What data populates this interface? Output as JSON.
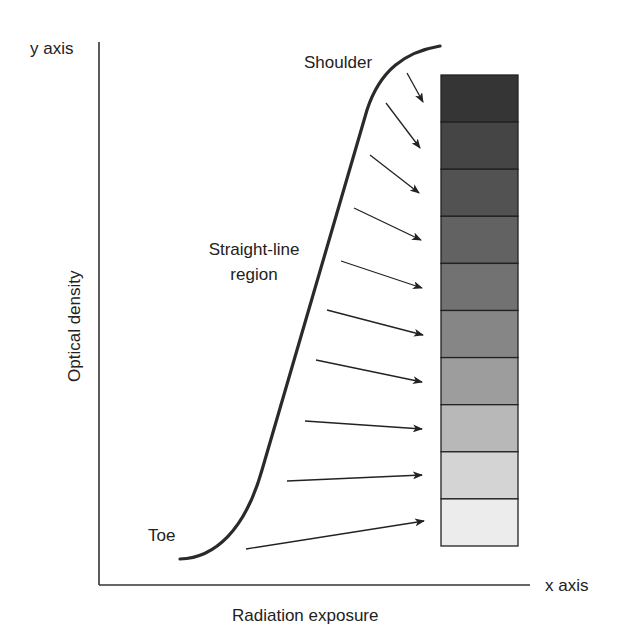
{
  "labels": {
    "y_axis": "y axis",
    "x_axis": "x axis",
    "y_title": "Optical density",
    "x_title": "Radiation exposure",
    "shoulder": "Shoulder",
    "straight_line_1": "Straight-line",
    "straight_line_2": "region",
    "toe": "Toe"
  },
  "step_wedge": {
    "steps": 10,
    "colors": [
      "#353535",
      "#454545",
      "#525252",
      "#626262",
      "#727272",
      "#868686",
      "#9d9d9d",
      "#b8b8b8",
      "#d4d4d4",
      "#ececec"
    ]
  },
  "arrow_count": 10,
  "colors": {
    "ink": "#222222",
    "background": "#ffffff"
  }
}
